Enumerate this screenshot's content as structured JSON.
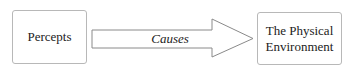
{
  "diagram": {
    "nodes": [
      {
        "id": "percepts",
        "label": "Percepts"
      },
      {
        "id": "environment",
        "label_line1": "The Physical",
        "label_line2": "Environment"
      }
    ],
    "edges": [
      {
        "from": "percepts",
        "to": "environment",
        "label": "Causes",
        "style": "block-arrow"
      }
    ],
    "colors": {
      "stroke": "#8a8a8a",
      "box_border": "#b8b8b8",
      "text": "#222222"
    }
  }
}
